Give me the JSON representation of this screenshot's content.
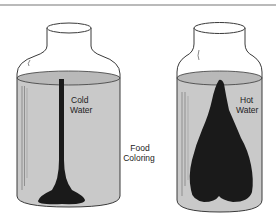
{
  "diagram": {
    "title": "",
    "jars": [
      {
        "id": "cold",
        "label_line1": "Cold",
        "label_line2": "Water",
        "dye_shape": "thin column descending to a pool at the bottom"
      },
      {
        "id": "hot",
        "label_line1": "Hot",
        "label_line2": "Water",
        "dye_shape": "broad spreading plume filling most of the jar"
      }
    ],
    "center_label_line1": "Food",
    "center_label_line2": "Coloring",
    "colors": {
      "water": "#c8c8c8",
      "glass_outline": "#3a3a3a",
      "dye": "#1a1a1a",
      "rule": "#777777",
      "background": "#ffffff"
    }
  }
}
